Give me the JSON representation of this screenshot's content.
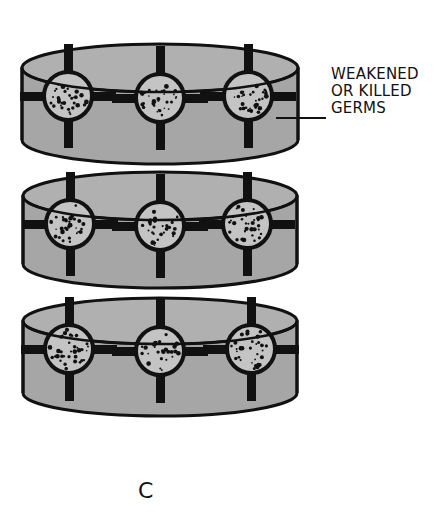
{
  "figure": {
    "label_lines": [
      "WEAKENED",
      "OR KILLED",
      "GERMS"
    ],
    "caption": "C"
  },
  "colors": {
    "dish_fill": "#a6a6a6",
    "dish_top_fill": "#b0b0b0",
    "outline": "#111111",
    "germ_fill": "#c4c4c4",
    "background": "#ffffff"
  },
  "dishes": [
    {
      "name": "dish-top",
      "cx": 160,
      "top": 68,
      "rx": 138,
      "ry": 24,
      "height": 72,
      "germs": [
        68,
        160,
        248
      ]
    },
    {
      "name": "dish-middle",
      "cx": 160,
      "top": 196,
      "rx": 137,
      "ry": 24,
      "height": 68,
      "germs": [
        70,
        160,
        247
      ]
    },
    {
      "name": "dish-bottom",
      "cx": 160,
      "top": 321,
      "rx": 137,
      "ry": 23,
      "height": 72,
      "germs": [
        69,
        160,
        251
      ]
    }
  ]
}
